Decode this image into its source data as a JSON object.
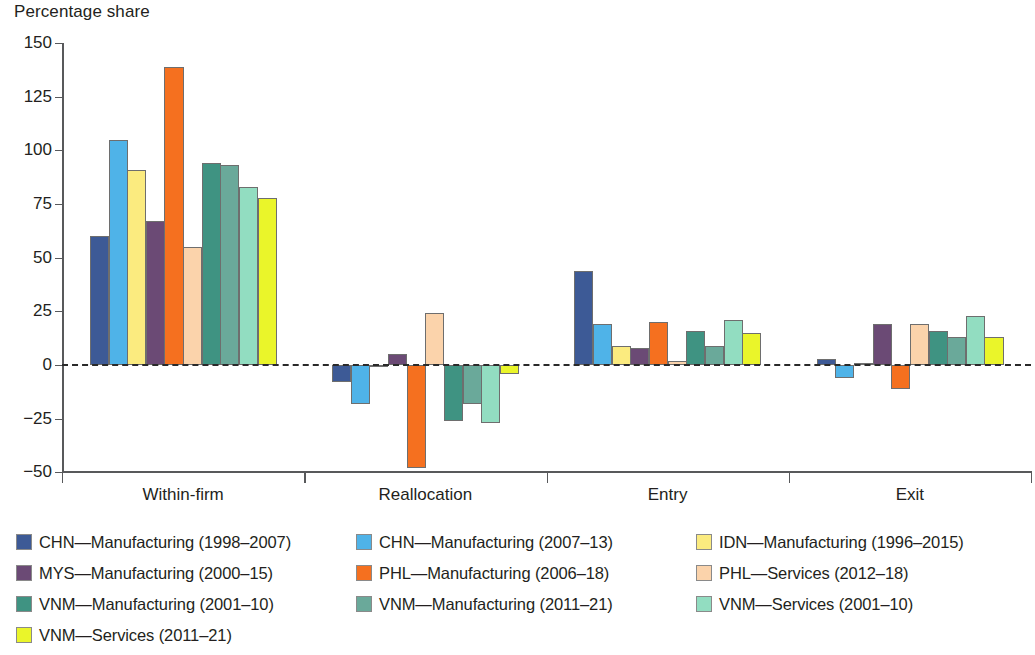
{
  "chart_data": {
    "type": "bar",
    "title": "",
    "subtitle": "",
    "ylabel": "Percentage share",
    "xlabel": "",
    "ylim": [
      -50,
      150
    ],
    "yticks": [
      150,
      125,
      100,
      75,
      50,
      25,
      0,
      -25,
      -50
    ],
    "ytick_labels": [
      "150",
      "125",
      "100",
      "75",
      "50",
      "25",
      "0",
      "−25",
      "−50"
    ],
    "grid": false,
    "zero_line": true,
    "legend_position": "bottom",
    "categories": [
      "Within-firm",
      "Reallocation",
      "Entry",
      "Exit"
    ],
    "series": [
      {
        "name": "CHN—Manufacturing (1998–2007)",
        "color": "#3d5a96",
        "values": [
          60,
          -8,
          44,
          3
        ]
      },
      {
        "name": "CHN—Manufacturing (2007–13)",
        "color": "#4fb3e8",
        "values": [
          105,
          -18,
          19,
          -6
        ]
      },
      {
        "name": "IDN—Manufacturing (1996–2015)",
        "color": "#fbeb7f",
        "values": [
          91,
          -1,
          9,
          1
        ]
      },
      {
        "name": "MYS—Manufacturing (2000–15)",
        "color": "#6b4a75",
        "values": [
          67,
          5,
          8,
          19
        ]
      },
      {
        "name": "PHL—Manufacturing (2006–18)",
        "color": "#f5701f",
        "values": [
          139,
          -48,
          20,
          -11
        ]
      },
      {
        "name": "PHL—Services (2012–18)",
        "color": "#fbd3ab",
        "values": [
          55,
          24,
          2,
          19
        ]
      },
      {
        "name": "VNM—Manufacturing (2001–10)",
        "color": "#3f9382",
        "values": [
          94,
          -26,
          16,
          16
        ]
      },
      {
        "name": "VNM—Manufacturing (2011–21)",
        "color": "#6aa99a",
        "values": [
          93,
          -18,
          9,
          13
        ]
      },
      {
        "name": "VNM—Services (2001–10)",
        "color": "#92ddc1",
        "values": [
          83,
          -27,
          21,
          23
        ]
      },
      {
        "name": "VNM—Services (2011–21)",
        "color": "#eaf52a",
        "values": [
          78,
          -4,
          15,
          13
        ]
      }
    ]
  },
  "legend": {
    "items": [
      {
        "label": "CHN—Manufacturing (1998–2007)",
        "color": "#3d5a96"
      },
      {
        "label": "CHN—Manufacturing (2007–13)",
        "color": "#4fb3e8"
      },
      {
        "label": "IDN—Manufacturing (1996–2015)",
        "color": "#fbeb7f"
      },
      {
        "label": "MYS—Manufacturing (2000–15)",
        "color": "#6b4a75"
      },
      {
        "label": "PHL—Manufacturing (2006–18)",
        "color": "#f5701f"
      },
      {
        "label": "PHL—Services (2012–18)",
        "color": "#fbd3ab"
      },
      {
        "label": "VNM—Manufacturing (2001–10)",
        "color": "#3f9382"
      },
      {
        "label": "VNM—Manufacturing (2011–21)",
        "color": "#6aa99a"
      },
      {
        "label": "VNM—Services (2001–10)",
        "color": "#92ddc1"
      },
      {
        "label": "VNM—Services (2011–21)",
        "color": "#eaf52a"
      }
    ]
  }
}
